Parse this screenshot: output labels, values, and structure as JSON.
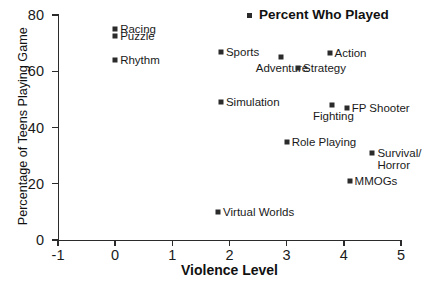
{
  "chart_data": {
    "type": "scatter",
    "title": "",
    "xlabel": "Violence Level",
    "ylabel": "Percentage of Teens Playing Game",
    "xlim": [
      -1,
      5
    ],
    "ylim": [
      0,
      80
    ],
    "xticks": [
      "-1",
      "0",
      "1",
      "2",
      "3",
      "4",
      "5"
    ],
    "yticks": [
      "0",
      "20",
      "40",
      "60",
      "80"
    ],
    "grid": false,
    "legend": {
      "position": "top-center",
      "entries": [
        "Percent Who Played"
      ]
    },
    "marker_color": "#2b2b2b",
    "points": [
      {
        "label": "Racing",
        "x": 0.0,
        "y": 75,
        "label_pos": "right"
      },
      {
        "label": "Puzzle",
        "x": 0.0,
        "y": 72.5,
        "label_pos": "right"
      },
      {
        "label": "Rhythm",
        "x": 0.0,
        "y": 64,
        "label_pos": "right"
      },
      {
        "label": "Sports",
        "x": 1.85,
        "y": 67,
        "label_pos": "right"
      },
      {
        "label": "Adventure",
        "x": 2.9,
        "y": 65,
        "label_pos": "below"
      },
      {
        "label": "Action",
        "x": 3.75,
        "y": 66.5,
        "label_pos": "right"
      },
      {
        "label": "Strategy",
        "x": 3.2,
        "y": 61,
        "label_pos": "right"
      },
      {
        "label": "Simulation",
        "x": 1.85,
        "y": 49,
        "label_pos": "right"
      },
      {
        "label": "Fighting",
        "x": 3.8,
        "y": 48,
        "label_pos": "below"
      },
      {
        "label": "FP Shooter",
        "x": 4.05,
        "y": 47,
        "label_pos": "right"
      },
      {
        "label": "Role Playing",
        "x": 3.0,
        "y": 35,
        "label_pos": "right"
      },
      {
        "label": "Survival/\nHorror",
        "x": 4.5,
        "y": 31,
        "label_pos": "right"
      },
      {
        "label": "MMOGs",
        "x": 4.1,
        "y": 21,
        "label_pos": "right"
      },
      {
        "label": "Virtual Worlds",
        "x": 1.8,
        "y": 10,
        "label_pos": "right"
      }
    ]
  }
}
